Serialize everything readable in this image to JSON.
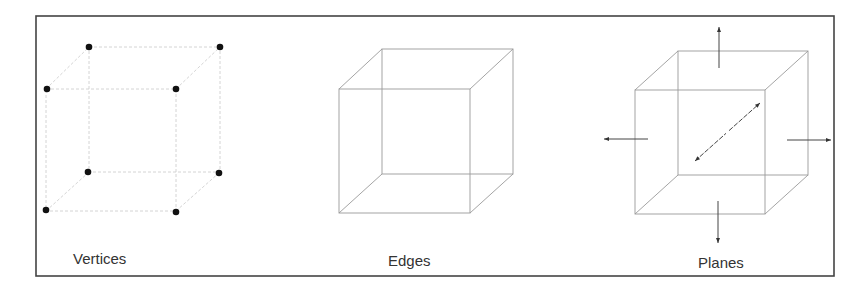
{
  "figure": {
    "width": 866,
    "height": 292,
    "frame": {
      "x": 36,
      "y": 16,
      "w": 798,
      "h": 260
    },
    "panels": [
      {
        "id": "vertices",
        "label": "Vertices",
        "label_pos": {
          "x": 73,
          "y": 264
        },
        "style": "faint",
        "cube": {
          "front": {
            "x1": 46,
            "y1": 89,
            "x2": 176,
            "y2": 211
          },
          "back": {
            "x1": 89,
            "y1": 47,
            "x2": 220,
            "y2": 172
          }
        },
        "vertices": [
          [
            89,
            47
          ],
          [
            220,
            47
          ],
          [
            47,
            89
          ],
          [
            176,
            89
          ],
          [
            88,
            172
          ],
          [
            219,
            173
          ],
          [
            46,
            210
          ],
          [
            176,
            212
          ]
        ]
      },
      {
        "id": "edges",
        "label": "Edges",
        "label_pos": {
          "x": 388,
          "y": 266
        },
        "style": "solid",
        "cube": {
          "front": {
            "x1": 339,
            "y1": 89,
            "x2": 470,
            "y2": 213
          },
          "back": {
            "x1": 382,
            "y1": 49,
            "x2": 513,
            "y2": 174
          }
        },
        "vertices": []
      },
      {
        "id": "planes",
        "label": "Planes",
        "label_pos": {
          "x": 698,
          "y": 268
        },
        "style": "solid",
        "cube": {
          "front": {
            "x1": 635,
            "y1": 90,
            "x2": 765,
            "y2": 214
          },
          "back": {
            "x1": 678,
            "y1": 51,
            "x2": 808,
            "y2": 175
          }
        },
        "vertices": [],
        "arrows": [
          {
            "name": "up-arrow",
            "from": [
              719,
              68
            ],
            "to": [
              719,
              27
            ],
            "double": false
          },
          {
            "name": "down-arrow",
            "from": [
              718,
              201
            ],
            "to": [
              718,
              243
            ],
            "double": false
          },
          {
            "name": "left-arrow",
            "from": [
              648,
              139
            ],
            "to": [
              604,
              139
            ],
            "double": false
          },
          {
            "name": "right-arrow",
            "from": [
              787,
              140
            ],
            "to": [
              831,
              140
            ],
            "double": false
          },
          {
            "name": "depth-arrow",
            "from": [
              695,
              161
            ],
            "to": [
              760,
              103
            ],
            "double": true
          }
        ]
      }
    ]
  }
}
